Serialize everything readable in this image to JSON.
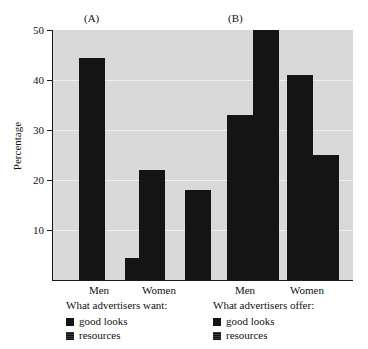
{
  "chart_data": {
    "type": "bar",
    "title": "",
    "xlabel": "",
    "ylabel": "Percentage",
    "ylim": [
      0,
      50
    ],
    "yticks": [
      10,
      20,
      30,
      40,
      50
    ],
    "ytick_labels": [
      "10",
      "20",
      "30",
      "40",
      "50"
    ],
    "grid": true,
    "legend_position": "below-axis",
    "panels": [
      {
        "caption": "(A)",
        "legend_title": "What advertisers want:",
        "categories": [
          "Men",
          "Women"
        ],
        "series": [
          {
            "name": "good looks",
            "values": [
              44.5,
              22
            ]
          },
          {
            "name": "resources",
            "values": [
              4.5,
              18
            ]
          }
        ]
      },
      {
        "caption": "(B)",
        "legend_title": "What advertisers offer:",
        "categories": [
          "Men",
          "Women"
        ],
        "series": [
          {
            "name": "good looks",
            "values": [
              33,
              41
            ]
          },
          {
            "name": "resources",
            "values": [
              50,
              25
            ]
          }
        ]
      }
    ]
  },
  "colors": {
    "bar": "#141414",
    "plot_background": "#d9d9d9",
    "gridline": "#efefef",
    "axis": "#1a1a1a",
    "page_background": "#ffffff",
    "text": "#111111"
  },
  "axis": {
    "ylabel": "Percentage",
    "ytick_labels": [
      "50",
      "40",
      "30",
      "20",
      "10"
    ]
  },
  "panel_a": {
    "caption": "(A)",
    "legend_title": "What advertisers want:",
    "legend_items": [
      "good looks",
      "resources"
    ],
    "cat_men": "Men",
    "cat_women": "Women"
  },
  "panel_b": {
    "caption": "(B)",
    "legend_title": "What advertisers offer:",
    "legend_items": [
      "good looks",
      "resources"
    ],
    "cat_men": "Men",
    "cat_women": "Women"
  }
}
